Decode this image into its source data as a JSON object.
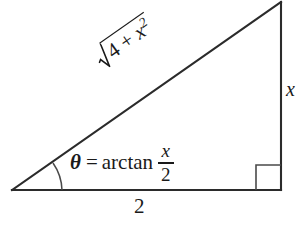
{
  "figure": {
    "type": "right-triangle-diagram",
    "background_color": "#ffffff",
    "line_color": "#2b2b2b",
    "vertices": {
      "left": [
        12,
        190
      ],
      "bottom_right": [
        281,
        190
      ],
      "top_right": [
        281,
        2
      ]
    },
    "hypotenuse_angle_deg": -35
  },
  "labels": {
    "hypotenuse": {
      "text": "sqrt(4 + x^2)",
      "radical_sign": "√",
      "radicand_prefix": "4 + ",
      "radicand_base": "x",
      "radicand_exponent": "2"
    },
    "vertical_side": "x",
    "base_side": "2",
    "equation": {
      "theta": "θ",
      "equals": "=",
      "function": "arctan",
      "fraction_numerator": "x",
      "fraction_denominator": "2",
      "full_text": "θ = arctan x/2"
    }
  },
  "markers": {
    "angle_arc": "angle-arc-theta",
    "right_angle": "right-angle-square"
  }
}
